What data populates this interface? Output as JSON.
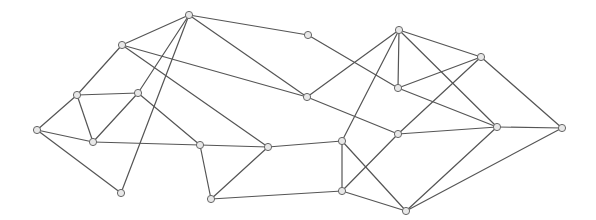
{
  "diagram": {
    "type": "undirected-graph",
    "style": {
      "edge_color": "#555555",
      "node_fill": "#e8e8e8",
      "node_stroke": "#666666",
      "node_radius": 3.6,
      "background": "#ffffff"
    },
    "nodes": [
      {
        "id": "n1",
        "x": 189,
        "y": 15
      },
      {
        "id": "n2",
        "x": 122,
        "y": 45
      },
      {
        "id": "n3",
        "x": 77,
        "y": 95
      },
      {
        "id": "n4",
        "x": 138,
        "y": 93
      },
      {
        "id": "n5",
        "x": 37,
        "y": 130
      },
      {
        "id": "n6",
        "x": 93,
        "y": 142
      },
      {
        "id": "n7",
        "x": 121,
        "y": 193
      },
      {
        "id": "n8",
        "x": 200,
        "y": 145
      },
      {
        "id": "n9",
        "x": 268,
        "y": 147
      },
      {
        "id": "n10",
        "x": 211,
        "y": 199
      },
      {
        "id": "n11",
        "x": 308,
        "y": 35
      },
      {
        "id": "n12",
        "x": 307,
        "y": 97
      },
      {
        "id": "n13",
        "x": 399,
        "y": 30
      },
      {
        "id": "n14",
        "x": 398,
        "y": 88
      },
      {
        "id": "n15",
        "x": 481,
        "y": 57
      },
      {
        "id": "n16",
        "x": 398,
        "y": 134
      },
      {
        "id": "n17",
        "x": 497,
        "y": 127
      },
      {
        "id": "n18",
        "x": 562,
        "y": 128
      },
      {
        "id": "n19",
        "x": 342,
        "y": 141
      },
      {
        "id": "n20",
        "x": 342,
        "y": 191
      },
      {
        "id": "n21",
        "x": 406,
        "y": 211
      }
    ],
    "edges": [
      [
        "n1",
        "n2"
      ],
      [
        "n1",
        "n4"
      ],
      [
        "n1",
        "n7"
      ],
      [
        "n1",
        "n11"
      ],
      [
        "n1",
        "n12"
      ],
      [
        "n2",
        "n3"
      ],
      [
        "n2",
        "n12"
      ],
      [
        "n2",
        "n9"
      ],
      [
        "n3",
        "n4"
      ],
      [
        "n3",
        "n5"
      ],
      [
        "n3",
        "n6"
      ],
      [
        "n4",
        "n6"
      ],
      [
        "n4",
        "n8"
      ],
      [
        "n5",
        "n6"
      ],
      [
        "n5",
        "n7"
      ],
      [
        "n6",
        "n8"
      ],
      [
        "n8",
        "n9"
      ],
      [
        "n8",
        "n10"
      ],
      [
        "n9",
        "n10"
      ],
      [
        "n9",
        "n19"
      ],
      [
        "n10",
        "n20"
      ],
      [
        "n11",
        "n14"
      ],
      [
        "n12",
        "n13"
      ],
      [
        "n12",
        "n16"
      ],
      [
        "n13",
        "n14"
      ],
      [
        "n13",
        "n15"
      ],
      [
        "n13",
        "n17"
      ],
      [
        "n13",
        "n19"
      ],
      [
        "n14",
        "n15"
      ],
      [
        "n14",
        "n17"
      ],
      [
        "n15",
        "n16"
      ],
      [
        "n15",
        "n18"
      ],
      [
        "n16",
        "n17"
      ],
      [
        "n16",
        "n20"
      ],
      [
        "n17",
        "n18"
      ],
      [
        "n17",
        "n21"
      ],
      [
        "n18",
        "n21"
      ],
      [
        "n19",
        "n20"
      ],
      [
        "n19",
        "n21"
      ],
      [
        "n20",
        "n21"
      ]
    ]
  }
}
